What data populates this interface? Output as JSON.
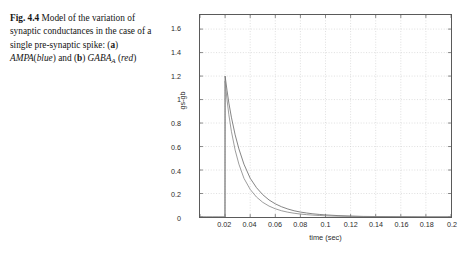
{
  "caption": {
    "figure_number": "Fig. 4.4",
    "line1_rest": "Model of the",
    "line2": "variation of synaptic",
    "line3": "conductances in the case of a",
    "line4_pre": "single pre-synaptic spike: (",
    "label_a": "a",
    "line4_post": ")",
    "line5_ampa": "AMPA",
    "line5_paren_open": "(",
    "line5_blue": "blue",
    "line5_and": ") and (",
    "label_b": "b",
    "line5_close": ") ",
    "gaba": "GABA",
    "gaba_sub": "A",
    "line6_open": "(",
    "line6_red": "red",
    "line6_close": ")"
  },
  "chart_data": {
    "type": "line",
    "title": "",
    "xlabel": "time (sec)",
    "ylabel": "gs-gb",
    "xlim": [
      0,
      0.2
    ],
    "ylim": [
      0,
      1.72
    ],
    "xticks": [
      "0",
      "0.02",
      "0.04",
      "0.06",
      "0.08",
      "0.1",
      "0.12",
      "0.14",
      "0.16",
      "0.18",
      "0.2"
    ],
    "xtick_values": [
      0,
      0.02,
      0.04,
      0.06,
      0.08,
      0.1,
      0.12,
      0.14,
      0.16,
      0.18,
      0.2
    ],
    "yticks": [
      "0",
      "0.2",
      "0.4",
      "0.6",
      "0.8",
      "1",
      "1.2",
      "1.4",
      "1.6"
    ],
    "ytick_values": [
      0,
      0.2,
      0.4,
      0.6,
      0.8,
      1.0,
      1.2,
      1.4,
      1.6
    ],
    "grid": true,
    "legend": "none",
    "series": [
      {
        "name": "AMPA",
        "color": "#6e6e6e",
        "x": [
          0,
          0.005,
          0.01,
          0.015,
          0.0199,
          0.02,
          0.0215,
          0.023,
          0.025,
          0.028,
          0.031,
          0.035,
          0.04,
          0.045,
          0.05,
          0.055,
          0.06,
          0.065,
          0.07,
          0.075,
          0.08,
          0.085,
          0.09,
          0.095,
          0.1,
          0.11,
          0.12,
          0.13,
          0.14,
          0.16,
          0.18,
          0.2
        ],
        "y": [
          0,
          0,
          0,
          0,
          0,
          1.2,
          1.08,
          0.97,
          0.85,
          0.7,
          0.58,
          0.45,
          0.33,
          0.25,
          0.19,
          0.145,
          0.112,
          0.087,
          0.068,
          0.053,
          0.042,
          0.034,
          0.027,
          0.022,
          0.018,
          0.012,
          0.008,
          0.005,
          0.004,
          0.002,
          0.001,
          0.001
        ]
      },
      {
        "name": "GABA_A",
        "color": "#8a8a8a",
        "x": [
          0,
          0.005,
          0.01,
          0.015,
          0.0199,
          0.02,
          0.0215,
          0.023,
          0.025,
          0.028,
          0.031,
          0.035,
          0.04,
          0.045,
          0.05,
          0.055,
          0.06,
          0.065,
          0.07,
          0.075,
          0.08,
          0.085,
          0.09,
          0.095,
          0.1,
          0.11,
          0.12,
          0.13,
          0.14,
          0.16,
          0.18,
          0.2
        ],
        "y": [
          0,
          0,
          0,
          0,
          0,
          1.16,
          1.0,
          0.87,
          0.73,
          0.57,
          0.45,
          0.33,
          0.235,
          0.17,
          0.125,
          0.093,
          0.07,
          0.053,
          0.041,
          0.032,
          0.025,
          0.02,
          0.016,
          0.013,
          0.01,
          0.007,
          0.005,
          0.004,
          0.003,
          0.002,
          0.001,
          0.001
        ]
      }
    ]
  }
}
